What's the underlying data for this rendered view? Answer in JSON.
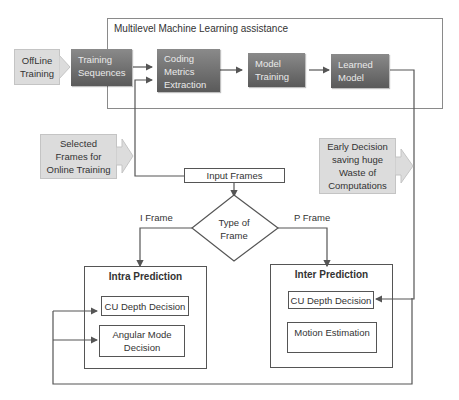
{
  "diagram": {
    "outer_title": "Multilevel Machine Learning assistance",
    "offline_training": "OffLine Training",
    "training_sequences": "Training Sequences",
    "coding_metrics": [
      "Coding",
      "Metrics",
      "Extraction"
    ],
    "model_training": [
      "Model",
      "Training"
    ],
    "learned_model": [
      "Learned",
      "Model"
    ],
    "selected_frames": [
      "Selected",
      "Frames for",
      "Online Training"
    ],
    "early_decision": [
      "Early Decision",
      "saving huge",
      "Waste of",
      "Computations"
    ],
    "input_frames": "Input Frames",
    "type_of_frame": [
      "Type of",
      "Frame"
    ],
    "i_frame_label": "I Frame",
    "p_frame_label": "P Frame",
    "intra": {
      "title": "Intra Prediction",
      "cu_depth": "CU Depth Decision",
      "angular_mode": [
        "Angular Mode",
        "Decision"
      ]
    },
    "inter": {
      "title": "Inter Prediction",
      "cu_depth": "CU Depth Decision",
      "motion_estimation": "Motion Estimation"
    }
  },
  "colors": {
    "dark_box": "#6e6e6e",
    "light_box": "#dcdcdc",
    "line": "#555555",
    "panel_border": "#8a8a8a"
  }
}
